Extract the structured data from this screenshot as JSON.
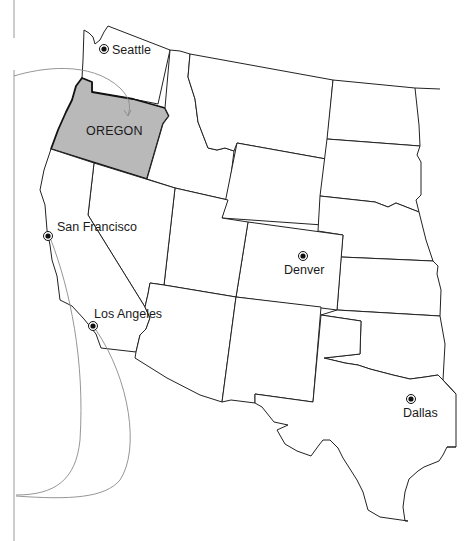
{
  "map": {
    "title": "",
    "highlight_state": {
      "name": "OREGON",
      "fill": "#b9b9b9"
    },
    "colors": {
      "background": "#ffffff",
      "stroke": "#222222",
      "highlight": "#b9b9b9",
      "route": "#8a8a8a"
    },
    "cities": [
      {
        "name": "Seattle",
        "x": 104,
        "y": 49
      },
      {
        "name": "San Francisco",
        "x": 48,
        "y": 236
      },
      {
        "name": "Los Angeles",
        "x": 93,
        "y": 326
      },
      {
        "name": "Denver",
        "x": 303,
        "y": 256
      },
      {
        "name": "Dallas",
        "x": 411,
        "y": 399
      }
    ],
    "state_labels": [
      {
        "name": "OREGON",
        "x": 110,
        "y": 133
      }
    ],
    "routes": [
      {
        "from": "frame-left",
        "to": "OREGON"
      },
      {
        "from": "San Francisco",
        "to": "frame-left-bottom"
      },
      {
        "from": "Los Angeles",
        "to": "frame-left-bottom"
      }
    ]
  }
}
